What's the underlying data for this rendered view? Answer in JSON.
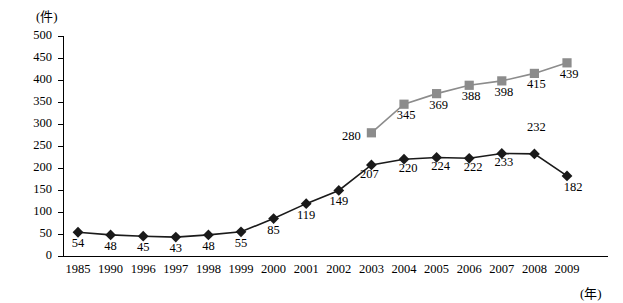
{
  "chart_data": {
    "type": "line",
    "title": "",
    "subtitle": "",
    "ylabel": "(件)",
    "xlabel": "(年)",
    "ylim": [
      0,
      500
    ],
    "yticks": [
      0,
      50,
      100,
      150,
      200,
      250,
      300,
      350,
      400,
      450,
      500
    ],
    "categories": [
      "1985",
      "1990",
      "1996",
      "1997",
      "1998",
      "1999",
      "2000",
      "2001",
      "2002",
      "2003",
      "2004",
      "2005",
      "2006",
      "2007",
      "2008",
      "2009"
    ],
    "grid": false,
    "legend": "none",
    "series": [
      {
        "name": "series-black-diamond",
        "marker": "diamond",
        "color": "#1a1a1a",
        "values": [
          54,
          48,
          45,
          43,
          48,
          55,
          85,
          119,
          149,
          207,
          220,
          224,
          222,
          233,
          232,
          182
        ],
        "labels": [
          "54",
          "48",
          "45",
          "43",
          "48",
          "55",
          "85",
          "119",
          "149",
          "207",
          "220",
          "224",
          "222",
          "233",
          "232",
          "182"
        ]
      },
      {
        "name": "series-gray-square",
        "marker": "square",
        "color": "#8c8c8c",
        "values": [
          null,
          null,
          null,
          null,
          null,
          null,
          null,
          null,
          null,
          280,
          345,
          369,
          388,
          398,
          415,
          439
        ],
        "labels": [
          "",
          "",
          "",
          "",
          "",
          "",
          "",
          "",
          "",
          "280",
          "345",
          "369",
          "388",
          "398",
          "415",
          "439"
        ]
      }
    ]
  },
  "annotations": {
    "y_unit": "(件)",
    "x_unit": "(年)"
  }
}
